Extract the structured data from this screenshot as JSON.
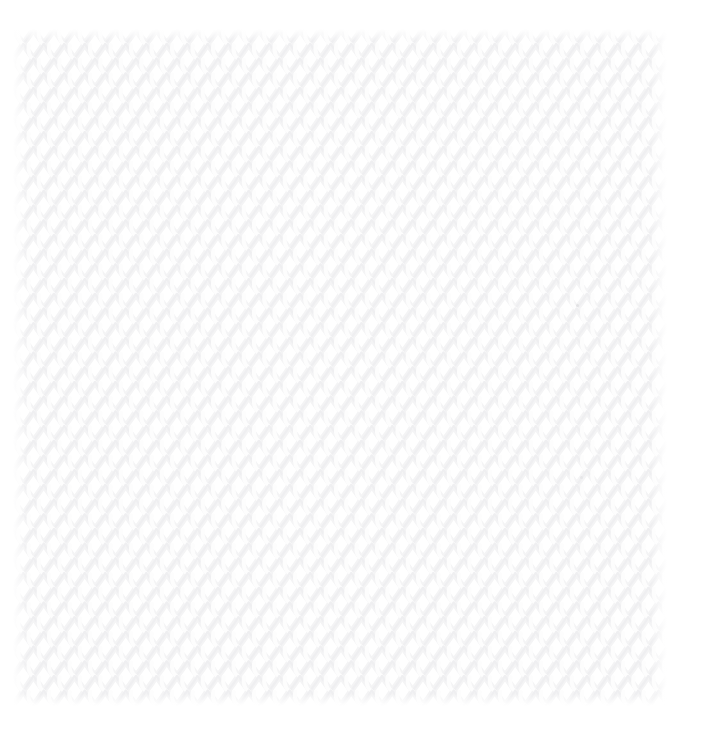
{
  "image": {
    "kind": "knit-fabric-texture",
    "description": "Close-up photograph of a plain white knitted fabric swatch in stockinette stitch, shown on a white background",
    "width": 709,
    "height": 741,
    "page_background": "#ffffff"
  },
  "swatch": {
    "label": "knitted fabric swatch",
    "x": 13,
    "y": 29,
    "width": 654,
    "height": 677,
    "fabric_color": "#ffffff",
    "stitch_shadow_color": "#efeff1",
    "stitch_midtone_color": "#f4f4f5",
    "stitch_highlight_color": "#fdfdfd",
    "stitch_type": "stockinette",
    "stitch_columns": 32,
    "stitch_rows": 46,
    "stitch_width": 20.5,
    "stitch_height": 14.7
  },
  "flecks": [
    {
      "name": "yarn-fleck-upper",
      "x": 576,
      "y": 304,
      "size": 3,
      "color": "#e2e2e4"
    },
    {
      "name": "yarn-fleck-lower",
      "x": 580,
      "y": 476,
      "size": 3,
      "color": "#e6e6e8"
    }
  ]
}
